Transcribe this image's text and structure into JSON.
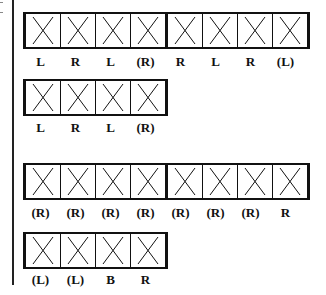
{
  "rows": [
    {
      "cells": 8,
      "top": 12,
      "label_top": 54,
      "labels": [
        "L",
        "R",
        "L",
        "(R)",
        "R",
        "L",
        "R",
        "(L)"
      ]
    },
    {
      "cells": 4,
      "top": 79,
      "label_top": 120,
      "labels": [
        "L",
        "R",
        "L",
        "(R)"
      ]
    },
    {
      "cells": 8,
      "top": 163,
      "label_top": 205,
      "labels": [
        "(R)",
        "(R)",
        "(R)",
        "(R)",
        "(R)",
        "(R)",
        "(R)",
        "R"
      ]
    },
    {
      "cells": 4,
      "top": 232,
      "label_top": 272,
      "labels": [
        "(L)",
        "(L)",
        "B",
        "R"
      ]
    }
  ],
  "cell_mark": "X",
  "colors": {
    "line": "#111111",
    "background": "#ffffff"
  }
}
